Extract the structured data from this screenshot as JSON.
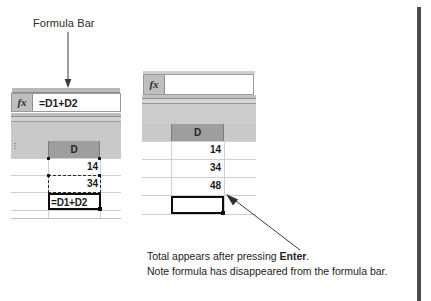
{
  "figure": {
    "callout": {
      "label": "Formula Bar",
      "arrow_icon": "down-arrow-icon"
    },
    "caption": {
      "line1_prefix": "Total appears after pressing ",
      "line1_bold": "Enter",
      "line1_suffix": ".",
      "line2": "Note formula has disappeared from the formula bar."
    },
    "pointer_icon": "diagonal-arrow-icon",
    "page_edge_icon": "page-edge-rule"
  },
  "before": {
    "name": "before-enter-screenshot",
    "formula_bar": {
      "fx_label": "fx",
      "value": "=D1+D2",
      "placeholder": ""
    },
    "column_header": "D",
    "cells": [
      {
        "value": "14",
        "state": "copied"
      },
      {
        "value": "34",
        "state": "copied"
      },
      {
        "value": "=D1+D2",
        "state": "editing"
      }
    ]
  },
  "after": {
    "name": "after-enter-screenshot",
    "formula_bar": {
      "fx_label": "fx",
      "value": "",
      "placeholder": ""
    },
    "column_header": "D",
    "cells": [
      {
        "value": "14",
        "state": "normal"
      },
      {
        "value": "34",
        "state": "normal"
      },
      {
        "value": "48",
        "state": "result"
      },
      {
        "value": "",
        "state": "selected"
      }
    ]
  },
  "colors": {
    "page_background": "#ffffff",
    "toolbar_gray": "#c9c9c9",
    "header_gray": "#9e9e9e",
    "gridline": "#cfcfcf",
    "text": "#1c1c1c",
    "edge_rule": "#4a4a4a"
  }
}
